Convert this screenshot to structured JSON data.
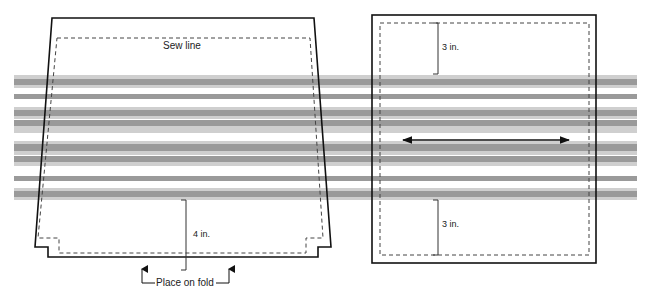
{
  "diagram": {
    "type": "sewing-pattern",
    "colors": {
      "outline": "#111111",
      "sew_line": "#444444",
      "stripe_dark": "#9a9a9a",
      "stripe_light": "#cfcfcf",
      "background": "#ffffff"
    },
    "stripes": [
      {
        "y": 75,
        "h": 4,
        "tone": "light"
      },
      {
        "y": 79,
        "h": 6,
        "tone": "dark"
      },
      {
        "y": 85,
        "h": 3,
        "tone": "light"
      },
      {
        "y": 94,
        "h": 5,
        "tone": "dark"
      },
      {
        "y": 107,
        "h": 3,
        "tone": "light"
      },
      {
        "y": 110,
        "h": 6,
        "tone": "dark"
      },
      {
        "y": 116,
        "h": 3,
        "tone": "light"
      },
      {
        "y": 120,
        "h": 6,
        "tone": "dark"
      },
      {
        "y": 126,
        "h": 7,
        "tone": "light"
      },
      {
        "y": 141,
        "h": 3,
        "tone": "light"
      },
      {
        "y": 144,
        "h": 7,
        "tone": "dark"
      },
      {
        "y": 151,
        "h": 4,
        "tone": "light"
      },
      {
        "y": 156,
        "h": 6,
        "tone": "dark"
      },
      {
        "y": 162,
        "h": 4,
        "tone": "light"
      },
      {
        "y": 176,
        "h": 5,
        "tone": "dark"
      },
      {
        "y": 188,
        "h": 3,
        "tone": "light"
      },
      {
        "y": 191,
        "h": 6,
        "tone": "dark"
      },
      {
        "y": 197,
        "h": 3,
        "tone": "light"
      }
    ],
    "left_piece": {
      "name": "front-piece",
      "sew_line_label": "Sew line",
      "height_label": "4 in.",
      "fold_label": "Place on fold"
    },
    "right_piece": {
      "name": "side-piece",
      "top_margin_label": "3 in.",
      "bottom_margin_label": "3 in.",
      "grainline": "double-headed-arrow"
    }
  }
}
